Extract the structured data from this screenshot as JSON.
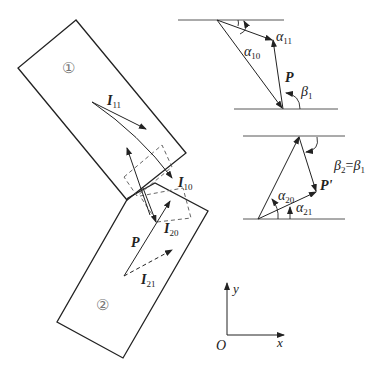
{
  "figure": {
    "block1": {
      "label": "①"
    },
    "block2": {
      "label": "②"
    },
    "vectors": {
      "I11": {
        "main": "I",
        "sub": "11"
      },
      "I10": {
        "main": "I",
        "sub": "10"
      },
      "I20": {
        "main": "I",
        "sub": "20"
      },
      "I21": {
        "main": "I",
        "sub": "21"
      },
      "P": {
        "main": "P"
      },
      "P_prime": {
        "main": "P'"
      }
    },
    "upper_triangle": {
      "alpha10": {
        "main": "α",
        "sub": "10"
      },
      "alpha11": {
        "main": "α",
        "sub": "11"
      },
      "P": {
        "main": "P"
      },
      "beta1": {
        "main": "β",
        "sub": "1"
      }
    },
    "lower_triangle": {
      "alpha20": {
        "main": "α",
        "sub": "20"
      },
      "alpha21": {
        "main": "α",
        "sub": "21"
      },
      "P_prime": {
        "main": "P'"
      },
      "relation": {
        "b2": "β",
        "b2sub": "2",
        "eq": "=",
        "b1": "β",
        "b1sub": "1"
      }
    },
    "axes": {
      "y": "y",
      "x": "x",
      "origin": "O"
    }
  }
}
